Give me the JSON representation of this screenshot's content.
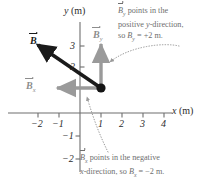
{
  "figure": {
    "type": "vector-decomposition-diagram",
    "axes": {
      "x_label": "x (m)",
      "x_label_var": "x",
      "x_label_unit": " (m)",
      "y_label": "y (m)",
      "y_label_var": "y",
      "y_label_unit": " (m)",
      "x_ticks": [
        "-2",
        "-1",
        "1",
        "2",
        "3",
        "4"
      ],
      "x_tick_values": [
        -2,
        -1,
        1,
        2,
        3,
        4
      ],
      "y_ticks": [
        "3",
        "2",
        "-1",
        "-2"
      ],
      "y_tick_values": [
        3,
        2,
        -1,
        -2
      ],
      "x_range": [
        -2.6,
        4.8
      ],
      "y_range": [
        -2.4,
        3.6
      ],
      "grid": false
    },
    "point": {
      "name": "tail-point",
      "x": 1,
      "y": 2
    },
    "vectors": [
      {
        "id": "B",
        "label": "B",
        "subscript": "",
        "color": "#1a1a1a",
        "from": [
          1,
          2
        ],
        "to": [
          -1,
          3
        ],
        "style": "bold-black",
        "label_pos": [
          -1.45,
          3.15
        ]
      },
      {
        "id": "Bx",
        "label": "B",
        "subscript": "x",
        "color": "#9a9a9a",
        "from": [
          1,
          2
        ],
        "to": [
          -1,
          2
        ],
        "style": "gray",
        "label_pos": [
          -1.75,
          2.25
        ],
        "component_value": "-2 m"
      },
      {
        "id": "By",
        "label": "B",
        "subscript": "y",
        "color": "#9a9a9a",
        "from": [
          1,
          0
        ],
        "to": [
          1,
          2
        ],
        "style": "gray",
        "label_pos": [
          0.55,
          3.3
        ],
        "component_value": "+2 m"
      }
    ],
    "annotations": [
      {
        "id": "by-note",
        "lines": [
          {
            "vec": "B",
            "sub": "y",
            "text": " points in the"
          },
          {
            "text": "positive ",
            "italic": "y",
            "text2": "-direction,"
          },
          {
            "text": "so ",
            "var": "B",
            "sub": "y",
            "text2": " = +2 m."
          }
        ],
        "target": "By",
        "leader": "dotted-curve"
      },
      {
        "id": "bx-note",
        "lines": [
          {
            "vec": "B",
            "sub": "x",
            "text": " points in the negative"
          },
          {
            "italic": "x",
            "text": "-direction, so ",
            "var": "B",
            "sub": "x",
            "text2": " = -2 m."
          }
        ],
        "target": "Bx",
        "leader": "dotted-curve"
      }
    ],
    "colors": {
      "axis": "#6e6e6e",
      "vector_main": "#1a1a1a",
      "vector_component": "#9a9a9a",
      "annotation_text": "#6f6f6f",
      "tick_text": "#2b2b2b",
      "background": "#ffffff"
    }
  },
  "text": {
    "note_by_line1_a": "B",
    "note_by_line1_sub": "y",
    "note_by_line1_b": " points in the",
    "note_by_line2_a": "positive ",
    "note_by_line2_i": "y",
    "note_by_line2_b": "-direction,",
    "note_by_line3_a": "so ",
    "note_by_line3_var": "B",
    "note_by_line3_sub": "y",
    "note_by_line3_b": " = +2 m.",
    "note_bx_line1_a": "B",
    "note_bx_line1_sub": "x",
    "note_bx_line1_b": " points in the negative",
    "note_bx_line2_i": "x",
    "note_bx_line2_a": "-direction, so ",
    "note_bx_line2_var": "B",
    "note_bx_line2_sub": "x",
    "note_bx_line2_b": " = −2 m.",
    "tick_xm2": "−2",
    "tick_xm1": "−1",
    "tick_x1": "1",
    "tick_x2": "2",
    "tick_x3": "3",
    "tick_x4": "4",
    "tick_y3": "3",
    "tick_y2": "2",
    "tick_ym1": "−1",
    "tick_ym2": "−2",
    "axis_x_var": "x",
    "axis_x_unit": " (m)",
    "axis_y_var": "y",
    "axis_y_unit": " (m)",
    "vec_B": "B",
    "vec_Bx": "B",
    "vec_Bx_sub": "x",
    "vec_By": "B",
    "vec_By_sub": "y"
  }
}
